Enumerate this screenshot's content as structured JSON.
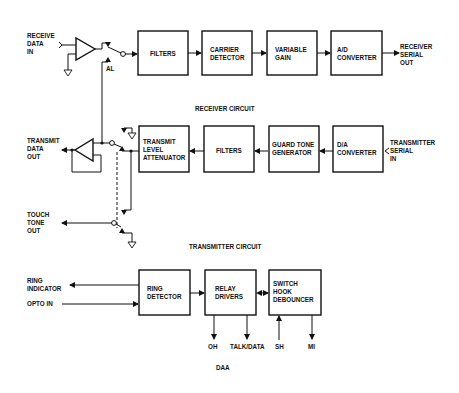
{
  "receiver": {
    "title": "RECEIVER CIRCUIT",
    "input_label": [
      "RECEIVE",
      "DATA",
      "IN"
    ],
    "switch_label": "AL",
    "blocks": [
      {
        "id": "filters",
        "lines": [
          "FILTERS"
        ]
      },
      {
        "id": "carrier-detector",
        "lines": [
          "CARRIER",
          "DETECTOR"
        ]
      },
      {
        "id": "variable-gain",
        "lines": [
          "VARIABLE",
          "GAIN"
        ]
      },
      {
        "id": "ad-converter",
        "lines": [
          "A/D",
          "CONVERTER"
        ]
      }
    ],
    "output_label": [
      "RECEIVER",
      "SERIAL",
      "OUT"
    ]
  },
  "transmitter": {
    "title": "TRANSMITTER CIRCUIT",
    "output_label": [
      "TRANSMIT",
      "DATA",
      "OUT"
    ],
    "touch_tone_label": [
      "TOUCH",
      "TONE",
      "OUT"
    ],
    "blocks": [
      {
        "id": "transmit-level-attenuator",
        "lines": [
          "TRANSMIT",
          "LEVEL",
          "ATTENUATOR"
        ]
      },
      {
        "id": "filters",
        "lines": [
          "FILTERS"
        ]
      },
      {
        "id": "guard-tone-generator",
        "lines": [
          "GUARD TONE",
          "GENERATOR"
        ]
      },
      {
        "id": "da-converter",
        "lines": [
          "D/A",
          "CONVERTER"
        ]
      }
    ],
    "input_label": [
      "TRANSMITTER",
      "SERIAL",
      "IN"
    ]
  },
  "daa": {
    "title": "DAA",
    "left_labels": {
      "ring_indicator": [
        "RING",
        "INDICATOR"
      ],
      "opto_in": "OPTO IN"
    },
    "blocks": [
      {
        "id": "ring-detector",
        "lines": [
          "RING",
          "DETECTOR"
        ]
      },
      {
        "id": "relay-drivers",
        "lines": [
          "RELAY",
          "DRIVERS"
        ]
      },
      {
        "id": "switch-hook-debouncer",
        "lines": [
          "SWITCH",
          "HOOK",
          "DEBOUNCER"
        ]
      }
    ],
    "signals": [
      "OH",
      "TALK/DATA",
      "SH",
      "MI"
    ]
  }
}
